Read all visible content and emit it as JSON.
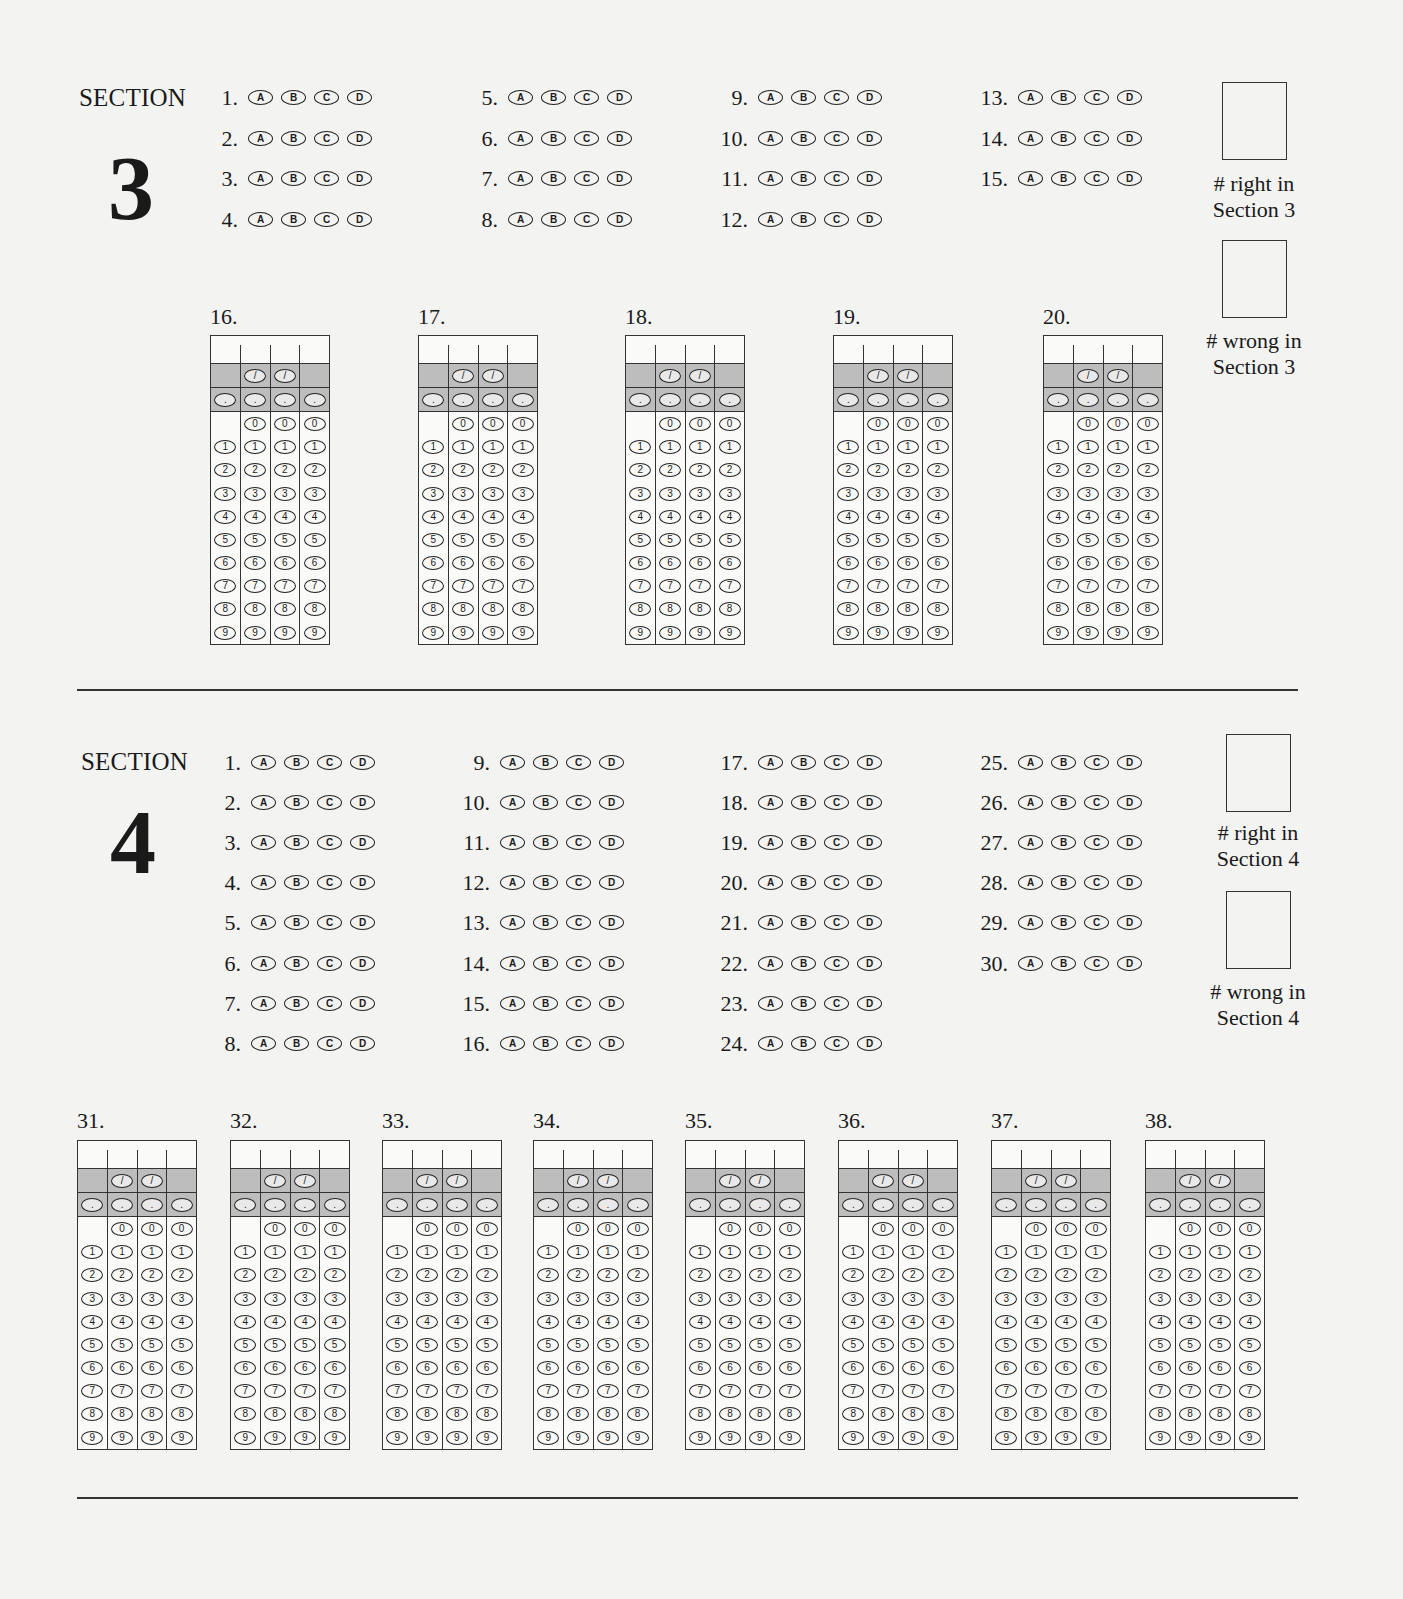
{
  "bubble_letters": [
    "A",
    "B",
    "C",
    "D"
  ],
  "grid_symbols": {
    "fraction": "/",
    "decimal": "."
  },
  "grid_digits": [
    "0",
    "1",
    "2",
    "3",
    "4",
    "5",
    "6",
    "7",
    "8",
    "9"
  ],
  "section3": {
    "label": "SECTION",
    "number": "3",
    "mc_columns": [
      {
        "x": 210,
        "questions": [
          "1.",
          "2.",
          "3.",
          "4."
        ]
      },
      {
        "x": 470,
        "questions": [
          "5.",
          "6.",
          "7.",
          "8."
        ]
      },
      {
        "x": 720,
        "questions": [
          "9.",
          "10.",
          "11.",
          "12."
        ]
      },
      {
        "x": 980,
        "questions": [
          "13.",
          "14.",
          "15."
        ]
      }
    ],
    "score_boxes": [
      {
        "line1": "# right in",
        "line2": "Section 3"
      },
      {
        "line1": "# wrong in",
        "line2": "Section 3"
      }
    ],
    "grid_in": [
      {
        "label": "16.",
        "x": 210
      },
      {
        "label": "17.",
        "x": 418
      },
      {
        "label": "18.",
        "x": 625
      },
      {
        "label": "19.",
        "x": 833
      },
      {
        "label": "20.",
        "x": 1043
      }
    ]
  },
  "section4": {
    "label": "SECTION",
    "number": "4",
    "mc_columns": [
      {
        "x": 213,
        "questions": [
          "1.",
          "2.",
          "3.",
          "4.",
          "5.",
          "6.",
          "7.",
          "8."
        ]
      },
      {
        "x": 462,
        "questions": [
          "9.",
          "10.",
          "11.",
          "12.",
          "13.",
          "14.",
          "15.",
          "16."
        ]
      },
      {
        "x": 720,
        "questions": [
          "17.",
          "18.",
          "19.",
          "20.",
          "21.",
          "22.",
          "23.",
          "24."
        ]
      },
      {
        "x": 980,
        "questions": [
          "25.",
          "26.",
          "27.",
          "28.",
          "29.",
          "30."
        ]
      }
    ],
    "score_boxes": [
      {
        "line1": "# right in",
        "line2": "Section 4"
      },
      {
        "line1": "# wrong in",
        "line2": "Section 4"
      }
    ],
    "grid_in": [
      {
        "label": "31.",
        "x": 77
      },
      {
        "label": "32.",
        "x": 230
      },
      {
        "label": "33.",
        "x": 382
      },
      {
        "label": "34.",
        "x": 533
      },
      {
        "label": "35.",
        "x": 685
      },
      {
        "label": "36.",
        "x": 838
      },
      {
        "label": "37.",
        "x": 991
      },
      {
        "label": "38.",
        "x": 1145
      }
    ]
  }
}
